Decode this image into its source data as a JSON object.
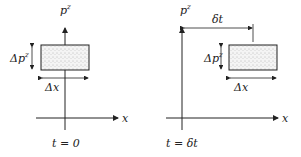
{
  "panels": [
    {
      "time_label": "t = 0",
      "y_axis_label": "p",
      "y_axis_sup": "z",
      "x_axis_label": "x",
      "dp_label": "Δp",
      "dp_sup": "z",
      "dx_label": "Δx"
    },
    {
      "time_label": "t = δt",
      "y_axis_label": "p",
      "y_axis_sup": "z",
      "x_axis_label": "x",
      "dp_label": "Δp",
      "dp_sup": "z",
      "dx_label": "Δx",
      "shift_label": "δt"
    }
  ],
  "colors": {
    "ink": "#222222",
    "box_fill": "#e8e8e8"
  }
}
